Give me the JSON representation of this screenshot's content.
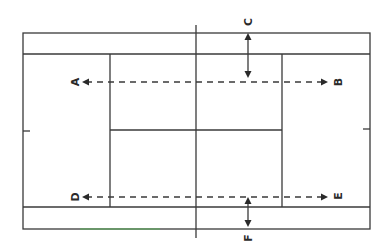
{
  "diagram": {
    "type": "tennis-court-top-view",
    "orientation": "rotated-90",
    "colors": {
      "background": "#ffffff",
      "line": "#3a3a3a",
      "label": "#2a2a2a",
      "green_tint": "#3fcf3f"
    },
    "labels": {
      "A": "A",
      "B": "B",
      "C": "C",
      "D": "D",
      "E": "E",
      "F": "F"
    },
    "arrows": [
      {
        "id": "A-B",
        "style": "dashed",
        "direction": "both-ends",
        "from": "A",
        "to": "B"
      },
      {
        "id": "D-E",
        "style": "dashed",
        "direction": "both-ends",
        "from": "D",
        "to": "E"
      },
      {
        "id": "C",
        "style": "solid",
        "direction": "double-headed",
        "label": "C"
      },
      {
        "id": "F",
        "style": "solid",
        "direction": "double-headed",
        "label": "F"
      }
    ]
  }
}
